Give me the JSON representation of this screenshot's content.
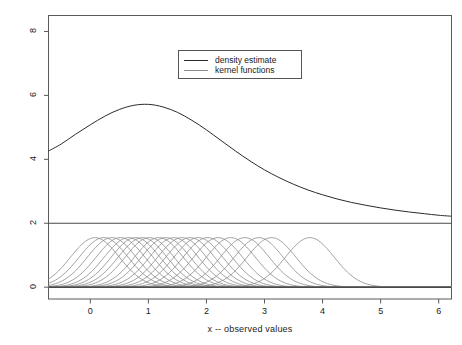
{
  "chart_data": {
    "type": "line",
    "title": "",
    "xlabel": "x -- observed values",
    "ylabel": "",
    "xlim": [
      -0.72,
      6.22
    ],
    "ylim": [
      -0.37,
      8.5
    ],
    "xticks": [
      0,
      1,
      2,
      3,
      4,
      5,
      6
    ],
    "xtick_labels": [
      "0",
      "1",
      "2",
      "3",
      "4",
      "5",
      "6"
    ],
    "yticks": [
      0,
      2,
      4,
      6,
      8
    ],
    "ytick_labels": [
      "0",
      "2",
      "4",
      "6",
      "8"
    ],
    "grid": false,
    "legend_position": "upper center",
    "legend": [
      {
        "label": "density estimate",
        "color": "#2b2b2b"
      },
      {
        "label": "kernel functions",
        "color": "#8c8c8c"
      }
    ],
    "annotations": [
      {
        "type": "hline",
        "y": 2.0,
        "color": "#4a4a4a",
        "note": "separator between density estimate panel and kernel panel"
      },
      {
        "type": "hline",
        "y": 0.0,
        "color": "#2b2b2b",
        "note": "baseline of kernel functions"
      }
    ],
    "series": [
      {
        "name": "density estimate",
        "color": "#2b2b2b",
        "shifted_up_by": 2.0,
        "peak": {
          "x": 0.95,
          "y": 5.72
        },
        "x": [
          -0.72,
          -0.5,
          -0.25,
          0.0,
          0.25,
          0.5,
          0.75,
          1.0,
          1.25,
          1.5,
          1.75,
          2.0,
          2.25,
          2.5,
          2.75,
          3.0,
          3.25,
          3.5,
          3.75,
          4.0,
          4.25,
          4.5,
          4.75,
          5.0,
          5.25,
          5.5,
          5.75,
          6.0,
          6.22
        ],
        "y": [
          4.26,
          4.48,
          4.79,
          5.08,
          5.35,
          5.56,
          5.69,
          5.72,
          5.64,
          5.47,
          5.22,
          4.92,
          4.59,
          4.26,
          3.95,
          3.67,
          3.43,
          3.22,
          3.04,
          2.89,
          2.76,
          2.65,
          2.56,
          2.48,
          2.41,
          2.35,
          2.3,
          2.25,
          2.22
        ]
      },
      {
        "name": "kernel functions",
        "color": "#8c8c8c",
        "kernel": "gaussian",
        "bandwidth": 0.42,
        "amplitude": 1.55,
        "centers": [
          0.08,
          0.23,
          0.37,
          0.52,
          0.66,
          0.78,
          0.9,
          1.02,
          1.18,
          1.3,
          1.44,
          1.58,
          1.72,
          1.86,
          2.02,
          2.2,
          2.42,
          2.66,
          2.9,
          3.12,
          3.78
        ]
      }
    ]
  },
  "axes": {
    "x_axis_title": "x -- observed values"
  }
}
